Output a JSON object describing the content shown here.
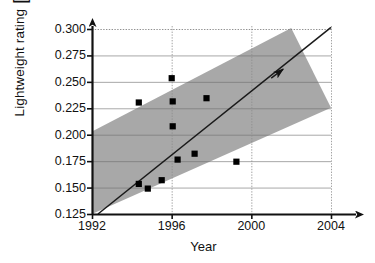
{
  "chart_data": {
    "type": "scatter",
    "title": "",
    "xlabel": "Year",
    "ylabel": "Lightweight rating",
    "ylabel_unit_open": "[",
    "ylabel_unit_close": "]",
    "ylabel_unit_numerator": "Nm/°m",
    "ylabel_unit_numerator_sup": "2",
    "ylabel_unit_denominator": "Kg 10",
    "ylabel_unit_denominator_sup": "3",
    "xlim": [
      1992,
      2004
    ],
    "ylim": [
      0.125,
      0.3
    ],
    "xticks": [
      1992,
      1996,
      2000,
      2004
    ],
    "xtick_labels": [
      "1992",
      "1996",
      "2000",
      "2004"
    ],
    "yticks": [
      0.125,
      0.15,
      0.175,
      0.2,
      0.225,
      0.25,
      0.275,
      0.3
    ],
    "ytick_labels": [
      "0.125",
      "0.150",
      "0.175",
      "0.200",
      "0.225",
      "0.250",
      "0.275",
      "0.300"
    ],
    "grid": true,
    "legend": "none",
    "marker": "square",
    "marker_color": "#000000",
    "points": [
      {
        "x": 1994.35,
        "y": 0.2305
      },
      {
        "x": 1996.0,
        "y": 0.2535
      },
      {
        "x": 1996.05,
        "y": 0.2315
      },
      {
        "x": 1997.75,
        "y": 0.2345
      },
      {
        "x": 1996.05,
        "y": 0.208
      },
      {
        "x": 1997.15,
        "y": 0.182
      },
      {
        "x": 1996.3,
        "y": 0.1765
      },
      {
        "x": 1999.25,
        "y": 0.1745
      },
      {
        "x": 1995.5,
        "y": 0.157
      },
      {
        "x": 1994.35,
        "y": 0.1535
      },
      {
        "x": 1994.8,
        "y": 0.149
      }
    ],
    "trend_line": {
      "label": "trend",
      "from": {
        "x": 1992.3,
        "y": 0.125
      },
      "to": {
        "x": 2004.0,
        "y": 0.3015
      },
      "arrow_at": {
        "x": 2001.6,
        "y": 0.262
      },
      "color": "#1a1a1a"
    },
    "band": {
      "label": "scatter band",
      "fill": "#a8a8a8",
      "upper_line": {
        "from": {
          "x": 1992.0,
          "y": 0.203
        },
        "to": {
          "x": 2002.0,
          "y": 0.301
        }
      },
      "lower_line": {
        "from": {
          "x": 1992.0,
          "y": 0.125
        },
        "to": {
          "x": 2004.0,
          "y": 0.2255
        }
      }
    },
    "axis_arrows": {
      "x": true,
      "y": true
    }
  }
}
